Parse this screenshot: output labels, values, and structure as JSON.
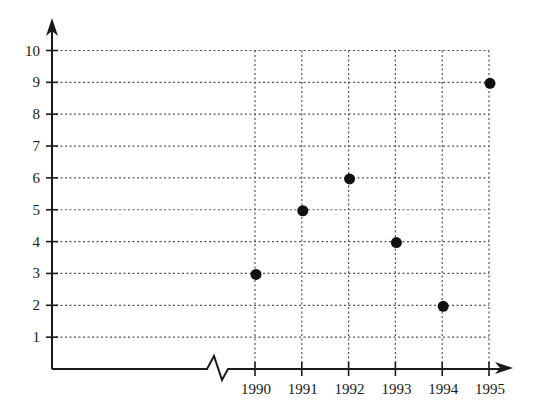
{
  "chart_data": {
    "type": "scatter",
    "title": "",
    "xlabel": "",
    "ylabel": "",
    "x": [
      1990,
      1991,
      1992,
      1993,
      1994,
      1995
    ],
    "categories": [
      "1990",
      "1991",
      "1992",
      "1993",
      "1994",
      "1995"
    ],
    "values": [
      3,
      5,
      6,
      4,
      2,
      9
    ],
    "series": [
      {
        "name": "",
        "values": [
          3,
          5,
          6,
          4,
          2,
          9
        ]
      }
    ],
    "xlim": [
      1990,
      1995
    ],
    "ylim": [
      0,
      10
    ],
    "y_ticks": [
      1,
      2,
      3,
      4,
      5,
      6,
      7,
      8,
      9,
      10
    ],
    "x_tick_labels": [
      "1990",
      "1991",
      "1992",
      "1993",
      "1994",
      "1995"
    ],
    "y_tick_labels": [
      "1",
      "2",
      "3",
      "4",
      "5",
      "6",
      "7",
      "8",
      "9",
      "10"
    ],
    "grid": true,
    "grid_style": "dotted",
    "x_axis_break": true,
    "legend": null,
    "marker_color": "#111111"
  }
}
